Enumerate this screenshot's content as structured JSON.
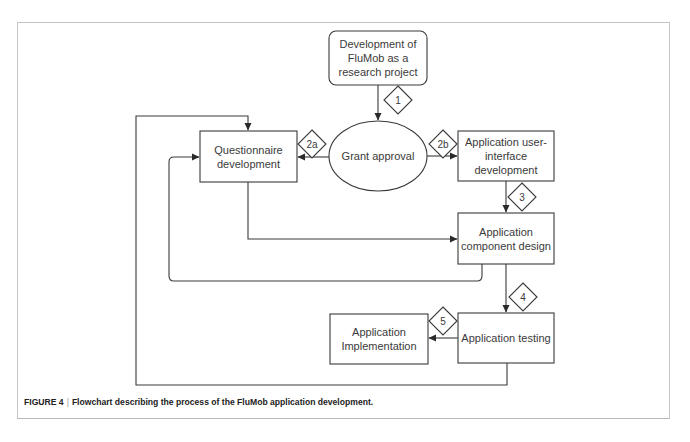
{
  "figure": {
    "label": "FIGURE 4",
    "separator": "|",
    "caption": "Flowchart describing the process of the FluMob application development."
  },
  "nodes": {
    "start": {
      "label": "Development of\nFluMob as a\nresearch project",
      "shape": "rounded-rectangle"
    },
    "grant": {
      "label": "Grant approval",
      "shape": "ellipse"
    },
    "questionnaire": {
      "label": "Questionnaire\ndevelopment",
      "shape": "rectangle"
    },
    "ui_dev": {
      "label": "Application user-\ninterface\ndevelopment",
      "shape": "rectangle"
    },
    "component": {
      "label": "Application\ncomponent design",
      "shape": "rectangle"
    },
    "testing": {
      "label": "Application testing",
      "shape": "rectangle"
    },
    "implementation": {
      "label": "Application\nImplementation",
      "shape": "rectangle"
    }
  },
  "steps": {
    "s1": "1",
    "s2a": "2a",
    "s2b": "2b",
    "s3": "3",
    "s4": "4",
    "s5": "5"
  },
  "edges": [
    {
      "from": "start",
      "to": "grant",
      "step": "1"
    },
    {
      "from": "grant",
      "to": "questionnaire",
      "step": "2a"
    },
    {
      "from": "grant",
      "to": "ui_dev",
      "step": "2b"
    },
    {
      "from": "ui_dev",
      "to": "component",
      "step": "3"
    },
    {
      "from": "questionnaire",
      "to": "component"
    },
    {
      "from": "component",
      "to": "questionnaire",
      "type": "feedback-loop"
    },
    {
      "from": "component",
      "to": "testing",
      "step": "4"
    },
    {
      "from": "testing",
      "to": "implementation",
      "step": "5"
    },
    {
      "from": "testing",
      "to": "questionnaire",
      "type": "feedback-loop"
    }
  ],
  "colors": {
    "stroke": "#3a3a3a",
    "frame": "#c4c4c4",
    "text": "#3a3a3a"
  }
}
